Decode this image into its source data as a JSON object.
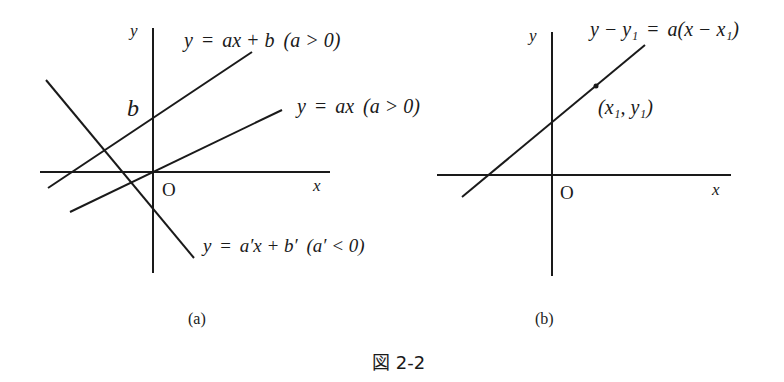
{
  "figure": {
    "caption": "図 2-2",
    "panels": [
      {
        "id": "a",
        "label": "(a)",
        "axis_labels": {
          "x": "x",
          "y": "y",
          "origin": "O"
        },
        "intercept_label": "b",
        "lines": [
          {
            "name": "line-ax-plus-b",
            "equation": "y = ax + b (a > 0)",
            "lhs": "y",
            "eq": "=",
            "rhs": "ax + b",
            "cond": "(a > 0)"
          },
          {
            "name": "line-ax",
            "equation": "y = ax (a > 0)",
            "lhs": "y",
            "eq": "=",
            "rhs": "ax",
            "cond": "(a > 0)"
          },
          {
            "name": "line-negative-slope",
            "equation": "y = a′x + b′ (a′ < 0)",
            "lhs": "y",
            "eq": "=",
            "rhs": "a′x + b′",
            "cond": "(a′ < 0)"
          }
        ]
      },
      {
        "id": "b",
        "label": "(b)",
        "axis_labels": {
          "x": "x",
          "y": "y",
          "origin": "O"
        },
        "point_label": "(x₁, y₁)",
        "lines": [
          {
            "name": "line-point-slope",
            "equation": "y − y₁ = a(x − x₁)",
            "lhs": "y − y₁",
            "eq": "=",
            "rhs": "a(x − x₁)"
          }
        ]
      }
    ]
  }
}
